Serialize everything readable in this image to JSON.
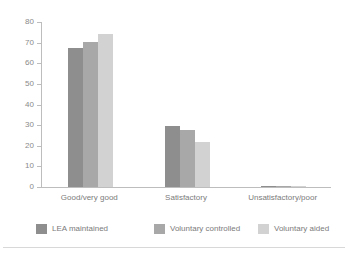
{
  "figure": {
    "title_remnant": "",
    "bottom_rule": "horizontal-divider"
  },
  "chart_data": {
    "type": "bar",
    "title": "",
    "subtitle": "",
    "xlabel": "",
    "ylabel": "",
    "categories": [
      "Good/very good",
      "Satisfactory",
      "Unsatisfactory/poor"
    ],
    "series": [
      {
        "name": "LEA maintained",
        "color": "#8e8e8e",
        "values": [
          67.5,
          29.5,
          0.6
        ]
      },
      {
        "name": "Voluntary controlled",
        "color": "#a8a8a8",
        "values": [
          70.5,
          27.5,
          0.4
        ]
      },
      {
        "name": "Voluntary aided",
        "color": "#d2d2d2",
        "values": [
          74.0,
          22.0,
          0.3
        ]
      }
    ],
    "ylim": [
      0,
      80
    ],
    "yticks": [
      0,
      10,
      20,
      30,
      40,
      50,
      60,
      70,
      80
    ],
    "ytick_labels": [
      "0",
      "10",
      "20",
      "30",
      "40",
      "50",
      "60",
      "70",
      "80"
    ],
    "grid": false,
    "legend_position": "bottom",
    "axis_color": "#bdbdbd",
    "tick_label_color": "#8a8a8a"
  }
}
